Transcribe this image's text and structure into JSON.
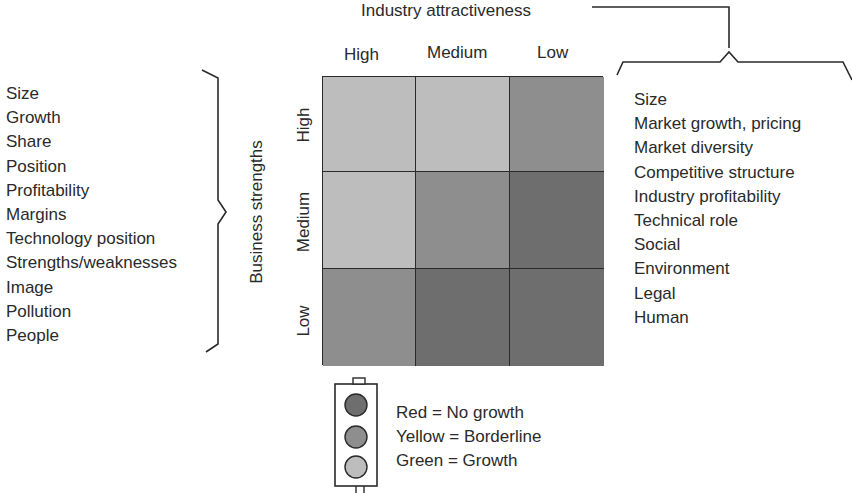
{
  "title": "Industry attractiveness",
  "column_headers": [
    "High",
    "Medium",
    "Low"
  ],
  "row_axis_title": "Business strengths",
  "row_headers": [
    "High",
    "Medium",
    "Low"
  ],
  "business_strength_factors": [
    "Size",
    "Growth",
    "Share",
    "Position",
    "Profitability",
    "Margins",
    "Technology position",
    "Strengths/weaknesses",
    "Image",
    "Pollution",
    "People"
  ],
  "industry_attractiveness_factors": [
    "Size",
    "Market growth, pricing",
    "Market diversity",
    "Competitive structure",
    "Industry profitability",
    "Technical role",
    "Social",
    "Environment",
    "Legal",
    "Human"
  ],
  "colors": {
    "green": "#bdbdbd",
    "yellow": "#8e8e8e",
    "red": "#6e6e6e",
    "line": "#2a2a2a"
  },
  "matrix": {
    "rows": [
      {
        "row": "High",
        "cells": [
          {
            "col": "High",
            "signal": "green"
          },
          {
            "col": "Medium",
            "signal": "green"
          },
          {
            "col": "Low",
            "signal": "yellow"
          }
        ]
      },
      {
        "row": "Medium",
        "cells": [
          {
            "col": "High",
            "signal": "green"
          },
          {
            "col": "Medium",
            "signal": "yellow"
          },
          {
            "col": "Low",
            "signal": "red"
          }
        ]
      },
      {
        "row": "Low",
        "cells": [
          {
            "col": "High",
            "signal": "yellow"
          },
          {
            "col": "Medium",
            "signal": "red"
          },
          {
            "col": "Low",
            "signal": "red"
          }
        ]
      }
    ]
  },
  "legend": [
    {
      "color": "Red",
      "meaning": "No growth",
      "text": "Red = No growth"
    },
    {
      "color": "Yellow",
      "meaning": "Borderline",
      "text": "Yellow = Borderline"
    },
    {
      "color": "Green",
      "meaning": "Growth",
      "text": "Green = Growth"
    }
  ]
}
